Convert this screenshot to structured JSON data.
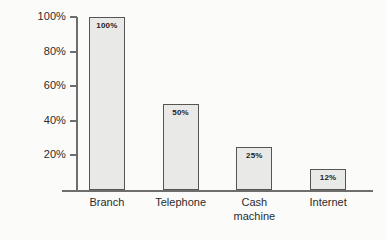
{
  "chart_data": {
    "type": "bar",
    "title": "",
    "subtitle": "",
    "xlabel": "",
    "ylabel": "",
    "categories": [
      "Branch",
      "Telephone",
      "Cash\nmachine",
      "Internet"
    ],
    "values": [
      100,
      50,
      25,
      12
    ],
    "value_labels": [
      "100%",
      "50%",
      "25%",
      "12%"
    ],
    "ylim": [
      0,
      100
    ],
    "y_ticks": [
      20,
      40,
      60,
      80,
      100
    ],
    "y_tick_labels": [
      "20%",
      "40%",
      "60%",
      "80%",
      "100%"
    ],
    "grid": false,
    "legend": false,
    "legend_position": "none",
    "orientation": "vertical",
    "colors": {
      "bar_fill": "#e9e9e7",
      "bar_border": "#555555",
      "axis": "#6e6e6e",
      "text": "#2b2b2b",
      "background": "#fbfbfa"
    }
  }
}
